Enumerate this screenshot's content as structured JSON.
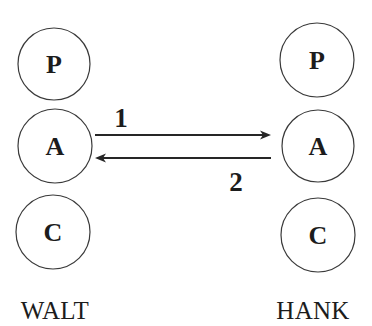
{
  "diagram": {
    "parties": [
      {
        "name": "WALT",
        "label_x": 55,
        "label_y": 319,
        "nodes": [
          {
            "letter": "P",
            "cx": 54,
            "cy": 64,
            "r": 36
          },
          {
            "letter": "A",
            "cx": 55,
            "cy": 146,
            "r": 37
          },
          {
            "letter": "C",
            "cx": 53,
            "cy": 232,
            "r": 37
          }
        ]
      },
      {
        "name": "HANK",
        "label_x": 313,
        "label_y": 319,
        "nodes": [
          {
            "letter": "P",
            "cx": 317,
            "cy": 60,
            "r": 37
          },
          {
            "letter": "A",
            "cx": 318,
            "cy": 146,
            "r": 36
          },
          {
            "letter": "C",
            "cx": 318,
            "cy": 235,
            "r": 37
          }
        ]
      }
    ],
    "transactions": [
      {
        "label": "1",
        "from": "WALT.A",
        "to": "HANK.A",
        "x1": 95,
        "x2": 271,
        "y": 135,
        "label_x": 121,
        "label_y": 127
      },
      {
        "label": "2",
        "from": "HANK.A",
        "to": "WALT.A",
        "x1": 271,
        "x2": 95,
        "y": 158,
        "label_x": 236,
        "label_y": 191
      }
    ],
    "colors": {
      "stroke": "#3a3a3a",
      "ink": "#1c1c1c",
      "background": "#ffffff"
    }
  }
}
